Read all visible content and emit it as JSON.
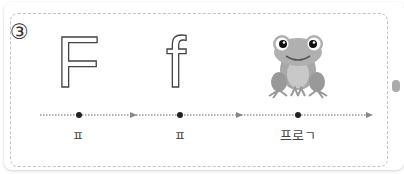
{
  "exercise": {
    "number": "③",
    "letters": [
      {
        "glyph": "F",
        "label": "ㅍ"
      },
      {
        "glyph": "f",
        "label": "ㅍ"
      },
      {
        "image": "frog-icon",
        "label": "프로ㄱ"
      }
    ]
  },
  "colors": {
    "dashed_border": "#c4c4c4",
    "dots": "#222222",
    "arrows": "#888888",
    "frog_body": "#a8a8a8"
  }
}
